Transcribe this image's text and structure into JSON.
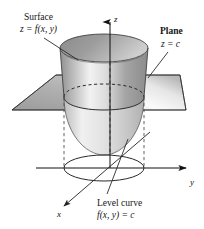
{
  "figure": {
    "kind": "3d-diagram",
    "background_color": "#ffffff",
    "ink_color": "#161616",
    "axes": [
      {
        "id": "z",
        "label": "z",
        "direction": "up"
      },
      {
        "id": "y",
        "label": "y",
        "direction": "right"
      },
      {
        "id": "x",
        "label": "x",
        "direction": "down-left"
      }
    ],
    "annotations": [
      {
        "id": "surface",
        "title": "Surface",
        "equation": "z = f(x, y)",
        "leader": true
      },
      {
        "id": "plane",
        "title": "Plane",
        "equation": "z = c",
        "leader": true
      },
      {
        "id": "level-curve",
        "title": "Level curve",
        "equation": "f(x, y) = c",
        "leader": true
      }
    ],
    "colors": {
      "plane_left_fill": "#a8a8a8",
      "plane_right_fill": "#efefef",
      "surface_outer_light": "#f4f4f4",
      "surface_outer_mid": "#a9a9a9",
      "surface_inner_dark": "#8e8e8e",
      "stroke": "#2b2b2b",
      "dashed": "#3a3a3a"
    }
  }
}
